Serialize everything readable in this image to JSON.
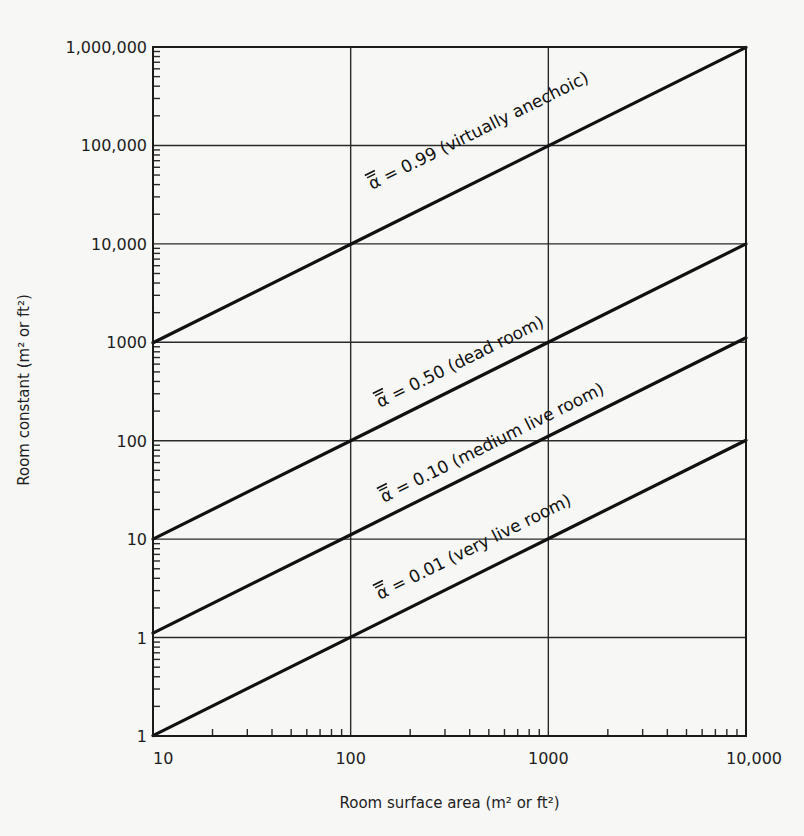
{
  "chart_data": {
    "type": "line",
    "title": "",
    "xlabel": "Room surface area (m² or ft²)",
    "ylabel": "Room constant (m² or ft²)",
    "xscale": "log",
    "yscale": "log",
    "xlim": [
      10,
      10000
    ],
    "ylim": [
      0.1,
      1000000
    ],
    "grid": true,
    "x_ticks": [
      10,
      100,
      1000,
      10000
    ],
    "x_tick_labels": [
      "10",
      "100",
      "1000",
      "10,000"
    ],
    "y_ticks": [
      0.1,
      1,
      10,
      100,
      1000,
      10000,
      100000,
      1000000
    ],
    "y_tick_labels": [
      "1",
      "1",
      "10",
      "100",
      "1000",
      "10,000",
      "100,000",
      "1,000,000"
    ],
    "x": [
      10,
      100,
      1000,
      10000
    ],
    "series": [
      {
        "name": "α̅ = 0.99 (virtually anechoic)",
        "alpha": 0.99,
        "description": "virtually anechoic",
        "values": [
          990,
          9900,
          99000,
          990000
        ]
      },
      {
        "name": "α̅ = 0.50 (dead room)",
        "alpha": 0.5,
        "description": "dead room",
        "values": [
          10,
          100,
          1000,
          10000
        ]
      },
      {
        "name": "α̅ = 0.10 (medium live room)",
        "alpha": 0.1,
        "description": "medium live room",
        "values": [
          1.11,
          11.1,
          111,
          1111
        ]
      },
      {
        "name": "α̅ = 0.01 (very live room)",
        "alpha": 0.01,
        "description": "very live room",
        "values": [
          0.101,
          1.01,
          10.1,
          101
        ]
      }
    ],
    "series_labels": [
      {
        "text": "α = 0.99 (virtually anechoic)",
        "symbol": "α",
        "rest": " = 0.99 (virtually anechoic)",
        "anchor_x": 180,
        "anchor_y": 9000
      },
      {
        "text": "α = 0.50 (dead room)",
        "symbol": "α",
        "rest": " = 0.50 (dead room)",
        "anchor_x": 180,
        "anchor_y": 95
      },
      {
        "text": "α = 0.10 (medium live room)",
        "symbol": "α",
        "rest": " = 0.10 (medium live room)",
        "anchor_x": 185,
        "anchor_y": 10
      },
      {
        "text": "α = 0.01 (very live room)",
        "symbol": "α",
        "rest": " = 0.01 (very live room)",
        "anchor_x": 185,
        "anchor_y": 0.95
      }
    ]
  },
  "plot_area": {
    "left": 153,
    "top": 47,
    "right": 746,
    "bottom": 736
  },
  "colors": {
    "background": "#f7f7f5",
    "line": "#111111",
    "grid": "#2a2a2a",
    "text": "#1e1e1e"
  }
}
